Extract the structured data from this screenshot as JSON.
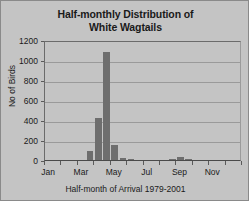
{
  "chart_data": {
    "type": "bar",
    "title": "Half-monthly Distribution of White Wagtails",
    "title_lines": [
      "Half-monthly Distribution of",
      "White Wagtails"
    ],
    "xlabel": "Half-month of Arrival 1979-2001",
    "ylabel": "No of Birds",
    "ylim": [
      0,
      1200
    ],
    "ytick_labels": [
      "1200",
      "1000",
      "800",
      "600",
      "400",
      "200",
      "0"
    ],
    "ytick_values": [
      1200,
      1000,
      800,
      600,
      400,
      200,
      0
    ],
    "grid": true,
    "legend": "none",
    "xtick_labels": [
      "Jan",
      "Mar",
      "May",
      "Jul",
      "Sep",
      "Nov"
    ],
    "xtick_values": [
      1,
      5,
      9,
      13,
      17,
      21
    ],
    "categories": [
      "Jan-1",
      "Jan-2",
      "Feb-1",
      "Feb-2",
      "Mar-1",
      "Mar-2",
      "Apr-1",
      "Apr-2",
      "May-1",
      "May-2",
      "Jun-1",
      "Jun-2",
      "Jul-1",
      "Jul-2",
      "Aug-1",
      "Aug-2",
      "Sep-1",
      "Sep-2",
      "Oct-1",
      "Oct-2",
      "Nov-1",
      "Nov-2",
      "Dec-1",
      "Dec-2"
    ],
    "values": [
      0,
      0,
      0,
      0,
      0,
      90,
      420,
      1080,
      150,
      20,
      5,
      0,
      0,
      0,
      0,
      5,
      30,
      5,
      0,
      0,
      0,
      0,
      0,
      0
    ],
    "bar_color": "#6e6e6e",
    "plot_background": "#c4c4c4"
  },
  "colors": {
    "background": "#c4c4c4",
    "bar": "#6e6e6e",
    "gridline": "#9a9a9a",
    "axis": "#5a5a5a",
    "text": "#1a1a1a"
  }
}
